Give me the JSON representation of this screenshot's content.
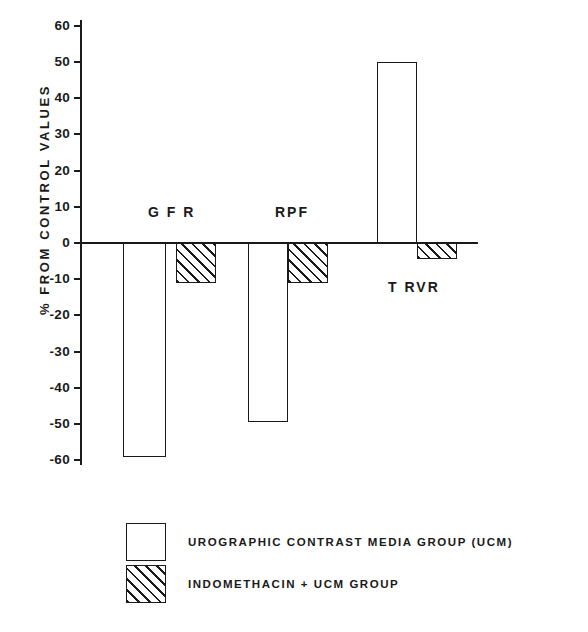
{
  "chart_data": {
    "type": "bar",
    "title": "",
    "xlabel": "",
    "ylabel": "% FROM CONTROL VALUES",
    "ylim": [
      -60,
      60
    ],
    "grid": false,
    "legend_position": "bottom",
    "categories": [
      "G F R",
      "RPF",
      "T RVR"
    ],
    "series": [
      {
        "name": "UROGRAPHIC CONTRAST MEDIA GROUP (UCM)",
        "pattern": "solid",
        "values": [
          -59,
          -49.5,
          50
        ]
      },
      {
        "name": "INDOMETHACIN + UCM GROUP",
        "pattern": "hatched",
        "values": [
          -11,
          -11,
          -4.5
        ]
      }
    ],
    "y_ticks": [
      60,
      50,
      40,
      30,
      20,
      10,
      0,
      -10,
      -20,
      -30,
      -40,
      -50,
      -60
    ],
    "y_tick_labels": [
      "60",
      "50",
      "40",
      "30",
      "20",
      "10",
      "0",
      "-10",
      "-20",
      "-30",
      "-40",
      "-50",
      "-60"
    ]
  },
  "axis": {
    "y_title": "% FROM CONTROL VALUES"
  },
  "groups": [
    {
      "label": "G F R"
    },
    {
      "label": "RPF"
    },
    {
      "label": "T RVR"
    }
  ],
  "legend": {
    "items": [
      {
        "label": "UROGRAPHIC  CONTRAST  MEDIA  GROUP (UCM)",
        "pattern": "solid"
      },
      {
        "label": "INDOMETHACIN + UCM  GROUP",
        "pattern": "hatched"
      }
    ]
  }
}
